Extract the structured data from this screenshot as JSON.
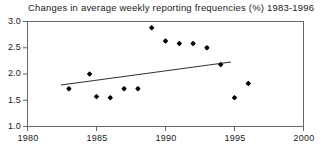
{
  "chart_data": {
    "type": "scatter",
    "title": "Changes in average weekly reporting frequencies (%) 1983-1996",
    "xlabel": "",
    "ylabel": "",
    "xlim": [
      1980,
      2000
    ],
    "ylim": [
      1.0,
      3.0
    ],
    "xticks": [
      1980,
      1985,
      1990,
      1995,
      2000
    ],
    "xtick_labels": [
      "1980",
      "1985",
      "1990",
      "1995",
      "2000"
    ],
    "yticks": [
      1.0,
      1.5,
      2.0,
      2.5,
      3.0
    ],
    "ytick_labels": [
      "1.0",
      "1.5",
      "2.0",
      "2.5",
      "3.0"
    ],
    "grid": false,
    "legend": "none",
    "marker": "filled-diamond",
    "marker_color": "#000000",
    "frame_color": "#555555",
    "x": [
      1983.0,
      1984.5,
      1985.0,
      1986.0,
      1987.0,
      1988.0,
      1989.0,
      1990.0,
      1991.0,
      1992.0,
      1993.0,
      1994.0,
      1995.0,
      1996.0
    ],
    "y": [
      1.72,
      2.0,
      1.57,
      1.55,
      1.72,
      1.72,
      2.88,
      2.63,
      2.58,
      2.58,
      2.5,
      2.18,
      1.55,
      1.82
    ],
    "points": [
      {
        "x": 1983.0,
        "y": 1.72
      },
      {
        "x": 1984.5,
        "y": 2.0
      },
      {
        "x": 1985.0,
        "y": 1.57
      },
      {
        "x": 1986.0,
        "y": 1.55
      },
      {
        "x": 1987.0,
        "y": 1.72
      },
      {
        "x": 1988.0,
        "y": 1.72
      },
      {
        "x": 1989.0,
        "y": 2.88
      },
      {
        "x": 1990.0,
        "y": 2.63
      },
      {
        "x": 1991.0,
        "y": 2.58
      },
      {
        "x": 1992.0,
        "y": 2.58
      },
      {
        "x": 1993.0,
        "y": 2.5
      },
      {
        "x": 1994.0,
        "y": 2.18
      },
      {
        "x": 1995.0,
        "y": 1.55
      },
      {
        "x": 1996.0,
        "y": 1.82
      }
    ],
    "trendline": {
      "type": "line",
      "x": [
        1982.5,
        1994.8
      ],
      "y": [
        1.78,
        2.22
      ],
      "color": "#333333"
    }
  }
}
